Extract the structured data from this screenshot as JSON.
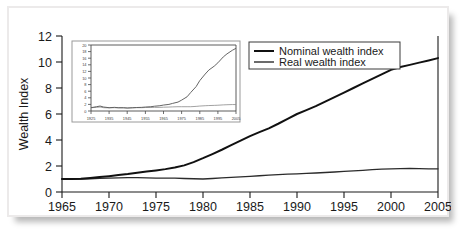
{
  "chart_data": {
    "type": "line",
    "title": "",
    "xlabel": "",
    "ylabel": "Wealth Index",
    "xlim": [
      1965,
      2005
    ],
    "ylim": [
      0,
      12
    ],
    "grid": false,
    "legend_position": "top-right",
    "x_ticks": [
      "1965",
      "1970",
      "1975",
      "1980",
      "1985",
      "1990",
      "1995",
      "2000",
      "2005"
    ],
    "y_ticks": [
      "0",
      "2",
      "4",
      "6",
      "8",
      "10",
      "12"
    ],
    "x": [
      1965,
      1966,
      1967,
      1968,
      1969,
      1970,
      1971,
      1972,
      1973,
      1974,
      1975,
      1976,
      1977,
      1978,
      1979,
      1980,
      1981,
      1982,
      1983,
      1984,
      1985,
      1986,
      1987,
      1988,
      1989,
      1990,
      1991,
      1992,
      1993,
      1994,
      1995,
      1996,
      1997,
      1998,
      1999,
      2000,
      2001,
      2002,
      2003,
      2004,
      2005
    ],
    "series": [
      {
        "name": "Nominal wealth index",
        "values": [
          1.0,
          1.0,
          1.02,
          1.08,
          1.15,
          1.22,
          1.3,
          1.38,
          1.48,
          1.57,
          1.66,
          1.76,
          1.88,
          2.05,
          2.3,
          2.6,
          2.92,
          3.25,
          3.6,
          3.95,
          4.3,
          4.6,
          4.9,
          5.25,
          5.62,
          6.0,
          6.3,
          6.6,
          6.95,
          7.3,
          7.65,
          8.0,
          8.35,
          8.7,
          9.05,
          9.4,
          9.62,
          9.78,
          9.95,
          10.12,
          10.3
        ]
      },
      {
        "name": "Real wealth index",
        "values": [
          1.0,
          1.0,
          1.0,
          1.02,
          1.05,
          1.07,
          1.09,
          1.1,
          1.1,
          1.08,
          1.07,
          1.07,
          1.06,
          1.04,
          1.02,
          1.0,
          1.04,
          1.08,
          1.12,
          1.16,
          1.2,
          1.25,
          1.3,
          1.34,
          1.37,
          1.4,
          1.43,
          1.46,
          1.5,
          1.54,
          1.58,
          1.62,
          1.67,
          1.72,
          1.76,
          1.78,
          1.8,
          1.82,
          1.8,
          1.78,
          1.78
        ]
      }
    ],
    "inset": {
      "type": "line",
      "xlim": [
        1925,
        2005
      ],
      "ylim": [
        0,
        20
      ],
      "x_ticks": [
        "1925",
        "1935",
        "1945",
        "1955",
        "1965",
        "1975",
        "1985",
        "1995",
        "2005"
      ],
      "y_ticks": [
        "0",
        "2",
        "4",
        "6",
        "8",
        "10",
        "12",
        "14",
        "16",
        "18",
        "20"
      ],
      "x": [
        1925,
        1928,
        1930,
        1932,
        1935,
        1938,
        1940,
        1943,
        1945,
        1948,
        1950,
        1953,
        1955,
        1958,
        1960,
        1963,
        1965,
        1968,
        1970,
        1973,
        1975,
        1978,
        1980,
        1983,
        1985,
        1988,
        1990,
        1993,
        1995,
        1998,
        2000,
        2003,
        2005
      ],
      "series": [
        {
          "name": "Nominal wealth index",
          "values": [
            1.0,
            1.3,
            1.5,
            1.2,
            1.0,
            1.1,
            1.0,
            1.0,
            0.9,
            1.0,
            1.05,
            1.1,
            1.2,
            1.3,
            1.45,
            1.6,
            1.8,
            2.0,
            2.3,
            2.7,
            3.3,
            4.3,
            5.6,
            7.4,
            9.2,
            11.2,
            12.4,
            13.6,
            14.6,
            16.4,
            17.3,
            18.4,
            19.0
          ]
        },
        {
          "name": "Real wealth index",
          "values": [
            1.0,
            1.1,
            1.2,
            1.0,
            0.95,
            1.0,
            0.95,
            0.95,
            0.9,
            0.95,
            1.0,
            1.0,
            1.05,
            1.05,
            1.1,
            1.1,
            1.15,
            1.2,
            1.25,
            1.3,
            1.3,
            1.3,
            1.3,
            1.4,
            1.5,
            1.6,
            1.65,
            1.7,
            1.75,
            1.85,
            1.9,
            1.95,
            1.95
          ]
        }
      ]
    },
    "legend": [
      {
        "label": "Nominal wealth index",
        "color": "#111111"
      },
      {
        "label": "Real wealth index",
        "color": "#2b2b2b"
      }
    ]
  },
  "axes": {
    "y_label": "Wealth Index",
    "y_ticks": [
      "12",
      "10",
      "8",
      "6",
      "4",
      "2",
      "0"
    ],
    "x_ticks": [
      "1965",
      "1970",
      "1975",
      "1980",
      "1985",
      "1990",
      "1995",
      "2000",
      "2005"
    ]
  },
  "inset_axes": {
    "y_ticks": [
      "20",
      "18",
      "16",
      "14",
      "12",
      "10",
      "8",
      "6",
      "4",
      "2",
      "0"
    ],
    "x_ticks": [
      "1925",
      "1935",
      "1945",
      "1955",
      "1965",
      "1975",
      "1985",
      "1995",
      "2005"
    ]
  },
  "legend": {
    "items": [
      {
        "label": "Nominal wealth index"
      },
      {
        "label": "Real wealth index"
      }
    ]
  }
}
